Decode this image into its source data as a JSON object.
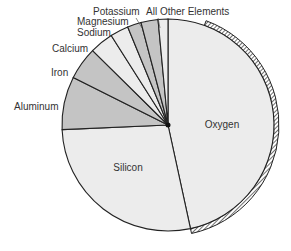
{
  "chart_data": {
    "type": "pie",
    "title": "",
    "start_angle_deg": 0,
    "direction": "clockwise",
    "slices": [
      {
        "label": "Oxygen",
        "value": 46.6,
        "color": "#ececec"
      },
      {
        "label": "Silicon",
        "value": 27.7,
        "color": "#ececec"
      },
      {
        "label": "Aluminum",
        "value": 8.1,
        "color": "#c4c4c4"
      },
      {
        "label": "Iron",
        "value": 5.0,
        "color": "#c4c4c4"
      },
      {
        "label": "Calcium",
        "value": 3.6,
        "color": "#ececec"
      },
      {
        "label": "Sodium",
        "value": 2.8,
        "color": "#ececec"
      },
      {
        "label": "Magnesium",
        "value": 2.1,
        "color": "#c4c4c4"
      },
      {
        "label": "Potassium",
        "value": 2.6,
        "color": "#c4c4c4"
      },
      {
        "label": "All Other Elements",
        "value": 1.5,
        "color": "#ececec"
      }
    ],
    "labels": {
      "oxygen": "Oxygen",
      "silicon": "Silicon",
      "aluminum": "Aluminum",
      "iron": "Iron",
      "calcium": "Calcium",
      "sodium": "Sodium",
      "magnesium": "Magnesium",
      "potassium": "Potassium",
      "other": "All Other Elements"
    },
    "legend": "none (direct labels)",
    "annotations": [
      "Hatched rim along outer edge of Oxygen slice"
    ]
  }
}
